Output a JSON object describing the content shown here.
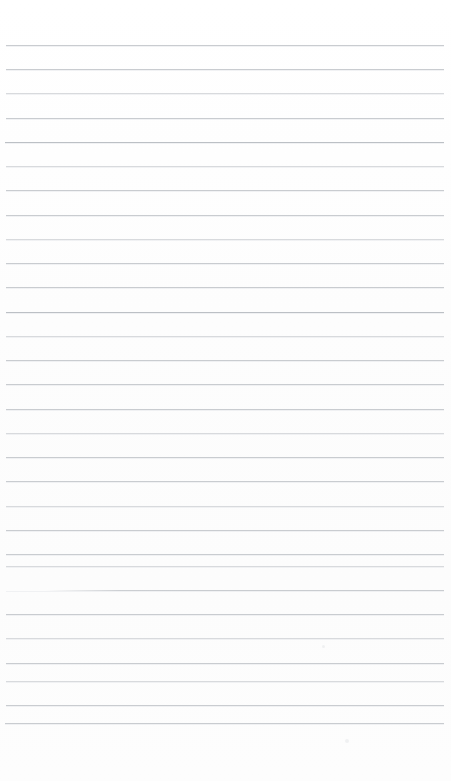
{
  "document": {
    "kind": "scanned-blank-ruled-paper",
    "page_width": 451,
    "page_height": 781,
    "background_color": "#fefefe",
    "rule_color": "#c9ccd0",
    "rule_color_faint": "#d8dadd",
    "rule_color_dark": "#bcc0c5",
    "top_margin": 45,
    "bottom_margin": 58,
    "left_margin": 6,
    "right_margin": 7,
    "line_spacing": 24.2,
    "line_count": 29,
    "text_content": "",
    "has_handwriting": false,
    "has_printed_text": false
  },
  "rules": [
    {
      "y": 45,
      "x": 6,
      "width": 438,
      "weight": "normal"
    },
    {
      "y": 69,
      "x": 6,
      "width": 438,
      "weight": "normal"
    },
    {
      "y": 93,
      "x": 6,
      "width": 438,
      "weight": "faint"
    },
    {
      "y": 118,
      "x": 6,
      "width": 438,
      "weight": "normal"
    },
    {
      "y": 142,
      "x": 5,
      "width": 439,
      "weight": "dark"
    },
    {
      "y": 166,
      "x": 6,
      "width": 438,
      "weight": "faint"
    },
    {
      "y": 190,
      "x": 6,
      "width": 438,
      "weight": "normal"
    },
    {
      "y": 215,
      "x": 6,
      "width": 438,
      "weight": "normal"
    },
    {
      "y": 239,
      "x": 6,
      "width": 438,
      "weight": "faint"
    },
    {
      "y": 263,
      "x": 6,
      "width": 438,
      "weight": "normal"
    },
    {
      "y": 287,
      "x": 6,
      "width": 438,
      "weight": "normal"
    },
    {
      "y": 312,
      "x": 6,
      "width": 438,
      "weight": "dark"
    },
    {
      "y": 336,
      "x": 6,
      "width": 438,
      "weight": "faint"
    },
    {
      "y": 360,
      "x": 6,
      "width": 438,
      "weight": "normal"
    },
    {
      "y": 384,
      "x": 6,
      "width": 438,
      "weight": "normal"
    },
    {
      "y": 409,
      "x": 6,
      "width": 438,
      "weight": "normal"
    },
    {
      "y": 433,
      "x": 6,
      "width": 438,
      "weight": "faint"
    },
    {
      "y": 457,
      "x": 6,
      "width": 438,
      "weight": "normal"
    },
    {
      "y": 481,
      "x": 6,
      "width": 438,
      "weight": "normal"
    },
    {
      "y": 506,
      "x": 6,
      "width": 438,
      "weight": "faint"
    },
    {
      "y": 530,
      "x": 6,
      "width": 438,
      "weight": "normal"
    },
    {
      "y": 554,
      "x": 6,
      "width": 438,
      "weight": "normal"
    },
    {
      "y": 566,
      "x": 6,
      "width": 438,
      "weight": "faint"
    },
    {
      "y": 590,
      "x": 6,
      "width": 438,
      "weight": "fade-left"
    },
    {
      "y": 614,
      "x": 6,
      "width": 438,
      "weight": "normal"
    },
    {
      "y": 638,
      "x": 6,
      "width": 438,
      "weight": "faint"
    },
    {
      "y": 663,
      "x": 6,
      "width": 438,
      "weight": "normal"
    },
    {
      "y": 681,
      "x": 6,
      "width": 438,
      "weight": "faint"
    },
    {
      "y": 705,
      "x": 6,
      "width": 438,
      "weight": "normal"
    },
    {
      "y": 723,
      "x": 5,
      "width": 439,
      "weight": "normal"
    }
  ],
  "specks": [
    {
      "x": 345,
      "y": 739,
      "size": 4
    },
    {
      "x": 322,
      "y": 645,
      "size": 3
    }
  ]
}
